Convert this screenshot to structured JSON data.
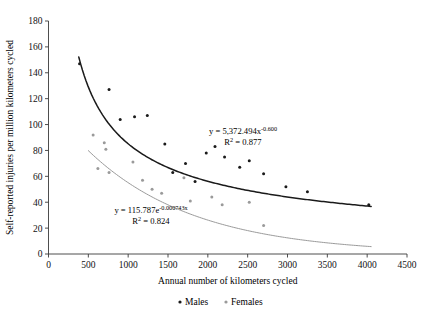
{
  "chart_data": {
    "type": "scatter",
    "title": "",
    "xlabel": "Annual number of kilometers cycled",
    "ylabel": "Self-reported injuries per million kilometers cycled",
    "xlim": [
      0,
      4500
    ],
    "ylim": [
      0,
      180
    ],
    "xticks": [
      0,
      500,
      1000,
      1500,
      2000,
      2500,
      3000,
      3500,
      4000,
      4500
    ],
    "yticks": [
      0,
      20,
      40,
      60,
      80,
      100,
      120,
      140,
      160,
      180
    ],
    "grid": false,
    "legend_position": "bottom",
    "series": [
      {
        "name": "Males",
        "color": "#1a1a1a",
        "marker": "dot",
        "points": [
          [
            390,
            147
          ],
          [
            760,
            127
          ],
          [
            900,
            104
          ],
          [
            1080,
            106
          ],
          [
            1240,
            107
          ],
          [
            1460,
            85
          ],
          [
            1560,
            63
          ],
          [
            1720,
            70
          ],
          [
            1840,
            56
          ],
          [
            1980,
            78
          ],
          [
            2090,
            83
          ],
          [
            2210,
            75
          ],
          [
            2400,
            67
          ],
          [
            2520,
            72
          ],
          [
            2700,
            62
          ],
          [
            2980,
            52
          ],
          [
            3250,
            48
          ],
          [
            4020,
            38
          ]
        ]
      },
      {
        "name": "Females",
        "color": "#9a9a9a",
        "marker": "dot",
        "points": [
          [
            560,
            92
          ],
          [
            700,
            86
          ],
          [
            720,
            81
          ],
          [
            620,
            66
          ],
          [
            760,
            63
          ],
          [
            1060,
            71
          ],
          [
            1180,
            57
          ],
          [
            1300,
            50
          ],
          [
            1420,
            47
          ],
          [
            1700,
            59
          ],
          [
            1780,
            41
          ],
          [
            2050,
            44
          ],
          [
            2180,
            38
          ],
          [
            2520,
            40
          ],
          [
            2700,
            22
          ]
        ]
      }
    ],
    "trendlines": [
      {
        "name": "Males trend",
        "series": "Males",
        "color": "#1a1a1a",
        "model": "power",
        "a": 5372.494,
        "b": -0.6,
        "x_start": 380,
        "x_end": 4050,
        "equation": "y = 5,372.494x",
        "equation_exponent": "-0.600",
        "r2_label": "R",
        "r2_sup": "2",
        "r2_value": " = 0.877"
      },
      {
        "name": "Females trend",
        "series": "Females",
        "color": "#9a9a9a",
        "model": "exponential",
        "a": 115.787,
        "b": -0.000743,
        "x_start": 500,
        "x_end": 4050,
        "equation": "y = 115.787e",
        "equation_exponent": "-0.000743x",
        "r2_label": "R",
        "r2_sup": "2",
        "r2_value": " = 0.824"
      }
    ],
    "legend": [
      {
        "label": "Males",
        "color": "#1a1a1a"
      },
      {
        "label": "Females",
        "color": "#9a9a9a"
      }
    ]
  }
}
